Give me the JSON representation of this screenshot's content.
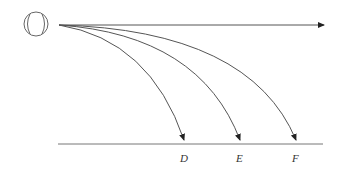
{
  "diagram": {
    "ball_icon": "baseball-icon",
    "stroke_color": "#555555",
    "labels": {
      "D": "D",
      "E": "E",
      "F": "F"
    }
  }
}
